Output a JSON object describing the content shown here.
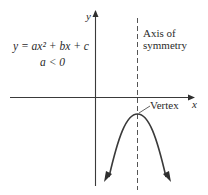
{
  "diagram": {
    "equation": "y = ax² + bx + c",
    "condition": "a < 0",
    "axes": {
      "x_label": "x",
      "y_label": "y"
    },
    "annotations": {
      "axis_of_symmetry_line1": "Axis of",
      "axis_of_symmetry_line2": "symmetry",
      "vertex": "Vertex"
    },
    "colors": {
      "line": "#3a3a3a",
      "dashed": "#555555",
      "text": "#2b2b2b",
      "background": "#ffffff"
    }
  }
}
